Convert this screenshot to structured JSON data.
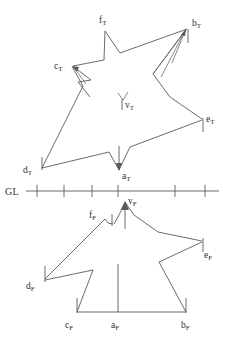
{
  "figure": {
    "background_color": "#ffffff",
    "stroke_color": "#5a5a5a",
    "label_color": "#2f2f2f",
    "ground_line": {
      "label": "GL",
      "y": 191,
      "x_start": 26,
      "x_end": 219,
      "tick_count": 6,
      "tick_positions": [
        37,
        64,
        92,
        118,
        175,
        205
      ],
      "tick_half_height": 6
    },
    "top_shape": {
      "name": "star-T",
      "suffix": "T",
      "points": [
        {
          "id": "a_T",
          "label_main": "a",
          "label_sub": "T",
          "x": 119,
          "y": 171,
          "label_x": 123,
          "label_y": 176
        },
        {
          "id": "b_T",
          "label_main": "b",
          "label_sub": "T",
          "x": 188,
          "y": 28,
          "label_x": 192,
          "label_y": 27
        },
        {
          "id": "c_T",
          "label_main": "c",
          "label_sub": "T",
          "x": 72,
          "y": 66,
          "label_x": 54,
          "label_y": 67
        },
        {
          "id": "d_T",
          "label_main": "d",
          "label_sub": "T",
          "x": 42,
          "y": 168,
          "label_x": 24,
          "label_y": 170
        },
        {
          "id": "e_T",
          "label_main": "e",
          "label_sub": "T",
          "x": 203,
          "y": 119,
          "label_x": 207,
          "label_y": 120
        },
        {
          "id": "f_T",
          "label_main": "f",
          "label_sub": "T",
          "x": 105,
          "y": 30,
          "label_x": 100,
          "label_y": 24
        },
        {
          "id": "v_T",
          "label_main": "v",
          "label_sub": "T",
          "x": 122,
          "y": 100,
          "label_x": 126,
          "label_y": 107
        }
      ],
      "outline_path": "M 119 171 L 109 152 L 72 158 L 42 168 L 83 85 L 72 66 L 105 30 L 120 52 L 188 28 L 153 73 L 168 96 L 203 119 L 130 146 Z",
      "arrow_lines": [
        {
          "from_x": 176,
          "from_y": 92,
          "to_x": 188,
          "to_y": 28,
          "name": "arrow-to-bT-left"
        },
        {
          "from_x": 155,
          "from_y": 74,
          "to_x": 188,
          "to_y": 28,
          "name": "arrow-to-bT-right"
        },
        {
          "from_x": 119,
          "from_y": 150,
          "to_x": 119,
          "to_y": 171,
          "name": "arrow-to-aT"
        },
        {
          "from_x": 86,
          "from_y": 83,
          "to_x": 72,
          "to_y": 66,
          "name": "arrow-to-cT"
        },
        {
          "from_x": 122,
          "from_y": 92,
          "to_x": 122,
          "to_y": 103,
          "name": "arrow-to-vT"
        }
      ]
    },
    "bottom_shape": {
      "name": "house-F",
      "suffix": "F",
      "points": [
        {
          "id": "a_F",
          "label_main": "a",
          "label_sub": "F",
          "x": 118,
          "y": 313,
          "label_x": 112,
          "label_y": 325
        },
        {
          "id": "b_F",
          "label_main": "b",
          "label_sub": "F",
          "x": 186,
          "y": 313,
          "label_x": 183,
          "label_y": 327
        },
        {
          "id": "c_F",
          "label_main": "c",
          "label_sub": "F",
          "x": 77,
          "y": 313,
          "label_x": 66,
          "label_y": 327
        },
        {
          "id": "d_F",
          "label_main": "d",
          "label_sub": "F",
          "x": 45,
          "y": 280,
          "label_x": 28,
          "label_y": 285
        },
        {
          "id": "e_F",
          "label_main": "e",
          "label_sub": "F",
          "x": 203,
          "y": 241,
          "label_x": 203,
          "label_y": 254
        },
        {
          "id": "f_F",
          "label_main": "f",
          "label_sub": "F",
          "x": 105,
          "y": 218,
          "label_x": 90,
          "label_y": 215
        },
        {
          "id": "v_F",
          "label_main": "v",
          "label_sub": "F",
          "x": 125,
          "y": 201,
          "label_x": 129,
          "label_y": 201
        }
      ],
      "outline_path": "M 77 313 L 93 270 L 45 280 L 105 218 L 114 224 L 125 201 L 158 232 L 203 241 L 159 262 L 186 313 Z",
      "baseline": {
        "x_start": 77,
        "y": 313,
        "x_end": 186
      },
      "center_stem": {
        "x": 118,
        "y_top": 264,
        "y_bottom": 313
      },
      "apex_stem": {
        "x": 125,
        "y_top": 205,
        "y_bottom": 229
      }
    },
    "vertex_ticks": [
      {
        "name": "tick-bT",
        "x": 188,
        "y_top": 28,
        "y_bottom": 42
      },
      {
        "name": "tick-eT",
        "x": 203,
        "y_top": 119,
        "y_bottom": 132
      },
      {
        "name": "tick-dT",
        "x": 42,
        "y_top": 156,
        "y_bottom": 170
      },
      {
        "name": "tick-fF",
        "x": 112,
        "y_top": 214,
        "y_bottom": 226
      },
      {
        "name": "tick-eF",
        "x": 203,
        "y_top": 238,
        "y_bottom": 252
      },
      {
        "name": "tick-dF",
        "x": 45,
        "y_top": 266,
        "y_bottom": 282
      },
      {
        "name": "tick-cF",
        "x": 77,
        "y_top": 299,
        "y_bottom": 313
      },
      {
        "name": "tick-bF",
        "x": 186,
        "y_top": 299,
        "y_bottom": 313
      }
    ]
  }
}
